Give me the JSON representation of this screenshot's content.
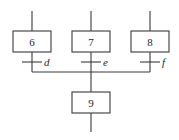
{
  "diagram": {
    "type": "grafcet-convergence",
    "steps": [
      {
        "id": "6",
        "label": "6"
      },
      {
        "id": "7",
        "label": "7"
      },
      {
        "id": "8",
        "label": "8"
      },
      {
        "id": "9",
        "label": "9"
      }
    ],
    "transitions": [
      {
        "from": "6",
        "to": "9",
        "condition": "d"
      },
      {
        "from": "7",
        "to": "9",
        "condition": "e"
      },
      {
        "from": "8",
        "to": "9",
        "condition": "f"
      }
    ],
    "colors": {
      "line": "#3a3a3a",
      "text": "#2a2a2a",
      "background": "#ffffff"
    }
  }
}
